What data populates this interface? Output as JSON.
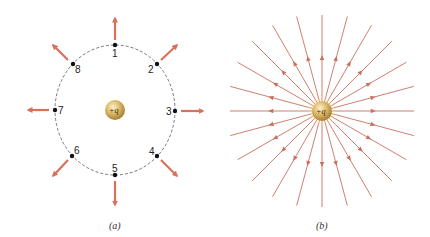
{
  "colors": {
    "arrow": "#d9705a",
    "field_line": "#c9705e",
    "dashed_circle": "#555555",
    "point": "#111111",
    "charge_light": "#f4e3b0",
    "charge_mid": "#d6b060",
    "charge_dark": "#a07a30"
  },
  "panel_a": {
    "caption": "(a)",
    "charge_label": "+q",
    "points": [
      {
        "label": "1"
      },
      {
        "label": "2"
      },
      {
        "label": "3"
      },
      {
        "label": "4"
      },
      {
        "label": "5"
      },
      {
        "label": "6"
      },
      {
        "label": "7"
      },
      {
        "label": "8"
      }
    ]
  },
  "panel_b": {
    "caption": "(b)",
    "charge_label": "+q",
    "field_line_count": 24
  }
}
